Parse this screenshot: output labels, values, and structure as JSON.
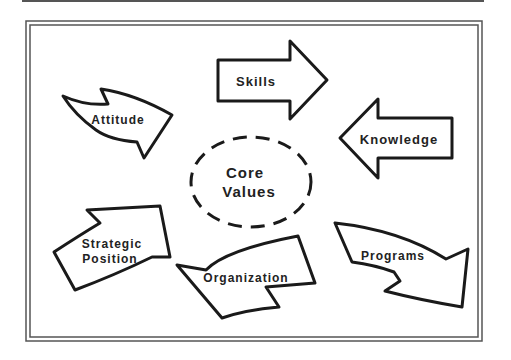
{
  "diagram": {
    "center": {
      "line1": "Core",
      "line2": "Values"
    },
    "arrows": [
      {
        "id": "skills",
        "label": "Skills"
      },
      {
        "id": "knowledge",
        "label": "Knowledge"
      },
      {
        "id": "programs",
        "label": "Programs"
      },
      {
        "id": "organization",
        "label": "Organization"
      },
      {
        "id": "strategic-position",
        "line1": "Strategic",
        "line2": "Position"
      },
      {
        "id": "attitude",
        "label": "Attitude"
      }
    ]
  },
  "colors": {
    "stroke": "#1a1a1a",
    "frame": "#555555",
    "background": "#ffffff"
  }
}
